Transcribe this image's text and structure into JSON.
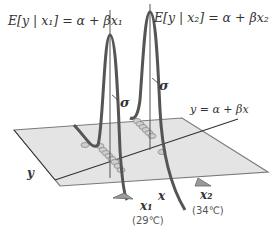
{
  "equations": {
    "left": "E[y | x₁] = α + βx₁",
    "right": "E[y | x₂] = α + βx₂",
    "regression_line": "y = α + βx"
  },
  "labels": {
    "sigma1": "σ",
    "sigma2": "σ",
    "y_axis": "y",
    "x_axis": "x",
    "x1": "x₁",
    "x2": "x₂",
    "x1_temp": "(29℃)",
    "x2_temp": "(34℃)"
  },
  "colors": {
    "curve": "#555555",
    "plane": "#e2e2e2",
    "plane_edge": "#777777",
    "line": "#333333",
    "marker": "#9a9a9a"
  }
}
